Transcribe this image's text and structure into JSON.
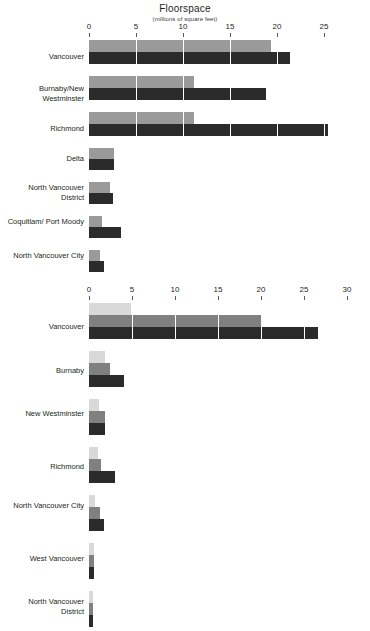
{
  "header": {
    "title": "Floorspace",
    "subtitle": "(millions of square feet)"
  },
  "chart_data": [
    {
      "type": "bar",
      "orientation": "horizontal",
      "title": "Floorspace",
      "subtitle": "(millions of square feet)",
      "xlabel": "",
      "ylabel": "",
      "xlim": [
        0,
        25
      ],
      "xticks": [
        0,
        5,
        10,
        15,
        20,
        25
      ],
      "xtick_labels": [
        "0",
        "5",
        "10",
        "15",
        "20",
        "25"
      ],
      "grid": true,
      "legend": "none",
      "categories": [
        "Vancouver",
        "Burnaby/New Westminster",
        "Richmond",
        "Delta",
        "North Vancouver District",
        "Coquitlam/ Port Moody",
        "North Vancouver City"
      ],
      "series": [
        {
          "name": "light",
          "color": "#9a9a9a",
          "values": [
            19.3,
            11.2,
            11.2,
            2.7,
            2.3,
            1.4,
            1.2
          ]
        },
        {
          "name": "dark",
          "color": "#2b2b2b",
          "values": [
            21.3,
            18.8,
            25.4,
            2.7,
            2.5,
            3.4,
            1.6
          ]
        }
      ]
    },
    {
      "type": "bar",
      "orientation": "horizontal",
      "title": "",
      "xlabel": "",
      "ylabel": "",
      "xlim": [
        0,
        30
      ],
      "xticks": [
        0,
        5,
        10,
        15,
        20,
        25,
        30
      ],
      "xtick_labels": [
        "0",
        "5",
        "10",
        "15",
        "20",
        "25",
        "30"
      ],
      "grid": true,
      "legend": "none",
      "categories": [
        "Vancouver",
        "Burnaby",
        "New Westminster",
        "Richmond",
        "North Vancouver City",
        "West Vancouver",
        "North Vancouver District"
      ],
      "series": [
        {
          "name": "lighter",
          "color": "#d9d9d9",
          "values": [
            4.9,
            1.9,
            1.2,
            1.0,
            0.7,
            0.6,
            0.4
          ]
        },
        {
          "name": "mid",
          "color": "#808080",
          "values": [
            20.0,
            2.5,
            1.9,
            1.4,
            1.3,
            0.6,
            0.4
          ]
        },
        {
          "name": "dark",
          "color": "#2b2b2b",
          "values": [
            26.6,
            4.1,
            1.9,
            3.0,
            1.7,
            0.6,
            0.4
          ]
        }
      ]
    }
  ],
  "chart1": {
    "axis": {
      "ticks": [
        {
          "label": "0",
          "x": 89
        },
        {
          "label": "5",
          "x": 136
        },
        {
          "label": "10",
          "x": 183
        },
        {
          "label": "15",
          "x": 230
        },
        {
          "label": "20",
          "x": 277
        },
        {
          "label": "25",
          "x": 324
        }
      ]
    },
    "rows": [
      {
        "label": "Vancouver",
        "label_top": 12,
        "top": 0,
        "height": 32,
        "bars": [
          {
            "shade": "light",
            "width": 182,
            "height": 12
          },
          {
            "shade": "dark",
            "width": 201,
            "height": 12
          }
        ]
      },
      {
        "label": "Burnaby/New Westminster",
        "label_top": 8,
        "top": 36,
        "height": 32,
        "bars": [
          {
            "shade": "light",
            "width": 105,
            "height": 12
          },
          {
            "shade": "dark",
            "width": 177,
            "height": 12
          }
        ]
      },
      {
        "label": "Richmond",
        "label_top": 12,
        "top": 72,
        "height": 32,
        "bars": [
          {
            "shade": "light",
            "width": 105,
            "height": 12
          },
          {
            "shade": "dark",
            "width": 239,
            "height": 12
          }
        ]
      },
      {
        "label": "Delta",
        "label_top": 6,
        "top": 108,
        "height": 26,
        "bars": [
          {
            "shade": "light",
            "width": 25,
            "height": 11
          },
          {
            "shade": "dark",
            "width": 25,
            "height": 11
          }
        ]
      },
      {
        "label": "North Vancouver District",
        "label_top": 1,
        "top": 142,
        "height": 26,
        "bars": [
          {
            "shade": "light",
            "width": 21,
            "height": 11
          },
          {
            "shade": "dark",
            "width": 24,
            "height": 11
          }
        ]
      },
      {
        "label": "Coquitlam/ Port Moody",
        "label_top": 1,
        "top": 176,
        "height": 26,
        "bars": [
          {
            "shade": "light",
            "width": 13,
            "height": 11
          },
          {
            "shade": "dark",
            "width": 32,
            "height": 11
          }
        ]
      },
      {
        "label": "North Vancouver City",
        "label_top": 1,
        "top": 210,
        "height": 26,
        "bars": [
          {
            "shade": "light",
            "width": 11,
            "height": 11
          },
          {
            "shade": "dark",
            "width": 15,
            "height": 11
          }
        ]
      }
    ]
  },
  "chart2": {
    "axis": {
      "ticks": [
        {
          "label": "0",
          "x": 89
        },
        {
          "label": "5",
          "x": 132
        },
        {
          "label": "10",
          "x": 175
        },
        {
          "label": "15",
          "x": 218
        },
        {
          "label": "20",
          "x": 261
        },
        {
          "label": "25",
          "x": 304
        },
        {
          "label": "30",
          "x": 347
        }
      ]
    },
    "rows": [
      {
        "label": "Vancouver",
        "label_top": 19,
        "top": 0,
        "height": 42,
        "bars": [
          {
            "shade": "lighter",
            "width": 42,
            "height": 12
          },
          {
            "shade": "mid",
            "width": 172,
            "height": 12
          },
          {
            "shade": "dark",
            "width": 229,
            "height": 12
          }
        ]
      },
      {
        "label": "Burnaby",
        "label_top": 15,
        "top": 48,
        "height": 42,
        "bars": [
          {
            "shade": "lighter",
            "width": 16,
            "height": 12
          },
          {
            "shade": "mid",
            "width": 21,
            "height": 12
          },
          {
            "shade": "dark",
            "width": 35,
            "height": 12
          }
        ]
      },
      {
        "label": "New Westminster",
        "label_top": 10,
        "top": 96,
        "height": 42,
        "bars": [
          {
            "shade": "lighter",
            "width": 10,
            "height": 12
          },
          {
            "shade": "mid",
            "width": 16,
            "height": 12
          },
          {
            "shade": "dark",
            "width": 16,
            "height": 12
          }
        ]
      },
      {
        "label": "Richmond",
        "label_top": 15,
        "top": 144,
        "height": 42,
        "bars": [
          {
            "shade": "lighter",
            "width": 9,
            "height": 12
          },
          {
            "shade": "mid",
            "width": 12,
            "height": 12
          },
          {
            "shade": "dark",
            "width": 26,
            "height": 12
          }
        ]
      },
      {
        "label": "North Vancouver City",
        "label_top": 6,
        "top": 192,
        "height": 42,
        "bars": [
          {
            "shade": "lighter",
            "width": 6,
            "height": 12
          },
          {
            "shade": "mid",
            "width": 11,
            "height": 12
          },
          {
            "shade": "dark",
            "width": 15,
            "height": 12
          }
        ]
      },
      {
        "label": "West Vancouver",
        "label_top": 11,
        "top": 240,
        "height": 42,
        "bars": [
          {
            "shade": "lighter",
            "width": 5,
            "height": 12
          },
          {
            "shade": "mid",
            "width": 5,
            "height": 12
          },
          {
            "shade": "dark",
            "width": 5,
            "height": 12
          }
        ]
      },
      {
        "label": "North Vancouver District",
        "label_top": 6,
        "top": 288,
        "height": 42,
        "bars": [
          {
            "shade": "lighter",
            "width": 4,
            "height": 12
          },
          {
            "shade": "mid",
            "width": 4,
            "height": 12
          },
          {
            "shade": "dark",
            "width": 4,
            "height": 12
          }
        ]
      }
    ]
  }
}
